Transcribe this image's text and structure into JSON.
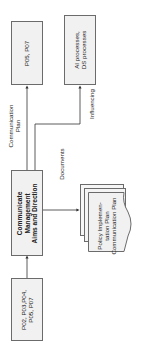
{
  "diagram": {
    "nodes": {
      "p05_p07": {
        "label_lines": [
          "P05, P07"
        ]
      },
      "ai_ds": {
        "label_lines": [
          "AI processes,",
          "DS processes"
        ]
      },
      "communicate": {
        "label_lines": [
          "Communicate",
          "Management",
          "Aims and Direction"
        ]
      },
      "documents_stack": {
        "label_lines": [
          "Policy Implemen-",
          "tation Plan",
          "Communication Plan"
        ]
      },
      "inputs": {
        "label_lines": [
          "P02, P03,P04,",
          "P05, P07"
        ]
      }
    },
    "edges": {
      "communication_plan": {
        "label_lines": [
          "Communication",
          "Plan"
        ]
      },
      "influencing": {
        "label_lines": [
          "Influencing"
        ]
      },
      "documents": {
        "label_lines": [
          "Documents"
        ]
      }
    },
    "colors": {
      "box_fill": "#f1f1f1",
      "box_border": "#6b6b6b",
      "line": "#333333"
    }
  }
}
